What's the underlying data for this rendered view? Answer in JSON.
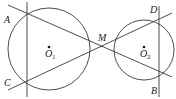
{
  "diagram": {
    "type": "geometry",
    "circles": [
      {
        "name": "O1",
        "label": "O",
        "subscript": "1"
      },
      {
        "name": "O2",
        "label": "O",
        "subscript": "2"
      }
    ],
    "points": {
      "A": "A",
      "B": "B",
      "C": "C",
      "D": "D",
      "M": "M"
    },
    "segments": [
      [
        "A",
        "B"
      ],
      [
        "C",
        "D"
      ],
      [
        "A",
        "C"
      ],
      [
        "D",
        "B"
      ]
    ],
    "line_color": "#3a3a3a"
  }
}
